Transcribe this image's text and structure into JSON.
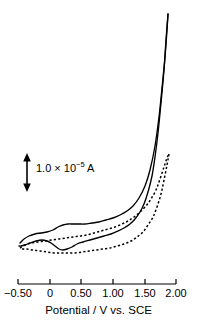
{
  "figure": {
    "background_color": "#ffffff",
    "line_color": "#000000",
    "width": 197,
    "height": 326
  },
  "annotations": {
    "scale_bar": {
      "label_main": "1.0 × 10",
      "label_exponent": "−5",
      "label_unit": " A",
      "arrow_name": "double-headed-vertical-arrow",
      "value": "1.0e-5",
      "unit": "A"
    }
  },
  "axis": {
    "x_title": "Potential / V vs. SCE",
    "x_ticks": [
      {
        "label": "−0.50",
        "value": -0.5,
        "px": 18
      },
      {
        "label": "0",
        "value": 0.0,
        "px": 50
      },
      {
        "label": "0.50",
        "value": 0.5,
        "px": 81
      },
      {
        "label": "1.00",
        "value": 1.0,
        "px": 113
      },
      {
        "label": "1.50",
        "value": 1.5,
        "px": 145
      },
      {
        "label": "2.00",
        "value": 2.0,
        "px": 176
      }
    ]
  },
  "chart_data": {
    "type": "line",
    "title": "",
    "subtitle": "",
    "xlabel": "Potential / V vs. SCE",
    "ylabel": "Current",
    "xlim": [
      -0.5,
      2.0
    ],
    "ylim_note": "Current axis unlabeled; vertical scale bar denotes 1.0 × 10⁻⁵ A",
    "grid": false,
    "legend": "none",
    "annotations": [
      {
        "type": "scale-bar",
        "text": "1.0 × 10⁻⁵ A",
        "orientation": "vertical",
        "x_px": 27,
        "y_top_px": 155,
        "y_bottom_px": 190
      }
    ],
    "series": [
      {
        "name": "solid-curve",
        "style": "solid",
        "color": "#000000",
        "description": "Cyclic voltammogram, first scan: anodic wave near 0.25 V, cathodic wave near 0.45 V, steep oxidation onset near 1.60 V rising off-scale at 1.85 V",
        "forward_points_px": [
          [
            20,
            243
          ],
          [
            24,
            239
          ],
          [
            29,
            236
          ],
          [
            35,
            234
          ],
          [
            41,
            233
          ],
          [
            47,
            232
          ],
          [
            53,
            230
          ],
          [
            58,
            227
          ],
          [
            63,
            225
          ],
          [
            68,
            224
          ],
          [
            73,
            224
          ],
          [
            79,
            224
          ],
          [
            85,
            224
          ],
          [
            92,
            223
          ],
          [
            99,
            222
          ],
          [
            106,
            220
          ],
          [
            113,
            218
          ],
          [
            120,
            215
          ],
          [
            127,
            211
          ],
          [
            133,
            206
          ],
          [
            139,
            198
          ],
          [
            145,
            186
          ],
          [
            150,
            170
          ],
          [
            155,
            146
          ],
          [
            159,
            117
          ],
          [
            162,
            88
          ],
          [
            165,
            57
          ],
          [
            167,
            30
          ],
          [
            168,
            14
          ]
        ],
        "reverse_points_px": [
          [
            168,
            14
          ],
          [
            166,
            40
          ],
          [
            164,
            70
          ],
          [
            161,
            103
          ],
          [
            158,
            133
          ],
          [
            155,
            157
          ],
          [
            152,
            176
          ],
          [
            148,
            192
          ],
          [
            144,
            204
          ],
          [
            140,
            212
          ],
          [
            135,
            219
          ],
          [
            130,
            224
          ],
          [
            124,
            228
          ],
          [
            118,
            231
          ],
          [
            111,
            234
          ],
          [
            104,
            236
          ],
          [
            97,
            238
          ],
          [
            90,
            240
          ],
          [
            83,
            242
          ],
          [
            77,
            244
          ],
          [
            72,
            247
          ],
          [
            67,
            249
          ],
          [
            63,
            250
          ],
          [
            59,
            249
          ],
          [
            55,
            246
          ],
          [
            51,
            243
          ],
          [
            47,
            241
          ],
          [
            42,
            240
          ],
          [
            36,
            241
          ],
          [
            30,
            243
          ],
          [
            25,
            245
          ],
          [
            21,
            246
          ],
          [
            19,
            246
          ]
        ]
      },
      {
        "name": "dashed-curve",
        "style": "dashed",
        "color": "#000000",
        "description": "Cyclic voltammogram, second (dashed) scan: suppressed redox waves, oxidation onset shifted positive, rising near 1.80 V",
        "forward_points_px": [
          [
            20,
            248
          ],
          [
            25,
            245
          ],
          [
            31,
            243
          ],
          [
            38,
            242
          ],
          [
            45,
            241
          ],
          [
            52,
            240
          ],
          [
            59,
            239
          ],
          [
            66,
            238
          ],
          [
            73,
            237
          ],
          [
            80,
            236
          ],
          [
            87,
            235
          ],
          [
            94,
            233
          ],
          [
            101,
            231
          ],
          [
            108,
            229
          ],
          [
            115,
            227
          ],
          [
            122,
            224
          ],
          [
            128,
            221
          ],
          [
            134,
            217
          ],
          [
            140,
            212
          ],
          [
            146,
            206
          ],
          [
            151,
            199
          ],
          [
            156,
            190
          ],
          [
            160,
            179
          ],
          [
            164,
            167
          ],
          [
            167,
            158
          ],
          [
            169,
            154
          ]
        ],
        "reverse_points_px": [
          [
            169,
            154
          ],
          [
            167,
            165
          ],
          [
            164,
            180
          ],
          [
            161,
            194
          ],
          [
            157,
            207
          ],
          [
            153,
            217
          ],
          [
            148,
            225
          ],
          [
            143,
            232
          ],
          [
            137,
            237
          ],
          [
            131,
            241
          ],
          [
            124,
            244
          ],
          [
            117,
            246
          ],
          [
            110,
            248
          ],
          [
            103,
            249
          ],
          [
            96,
            250
          ],
          [
            89,
            251
          ],
          [
            82,
            252
          ],
          [
            75,
            253
          ],
          [
            68,
            253
          ],
          [
            61,
            253
          ],
          [
            54,
            253
          ],
          [
            47,
            252
          ],
          [
            40,
            251
          ],
          [
            33,
            250
          ],
          [
            26,
            249
          ],
          [
            20,
            249
          ]
        ]
      }
    ]
  }
}
